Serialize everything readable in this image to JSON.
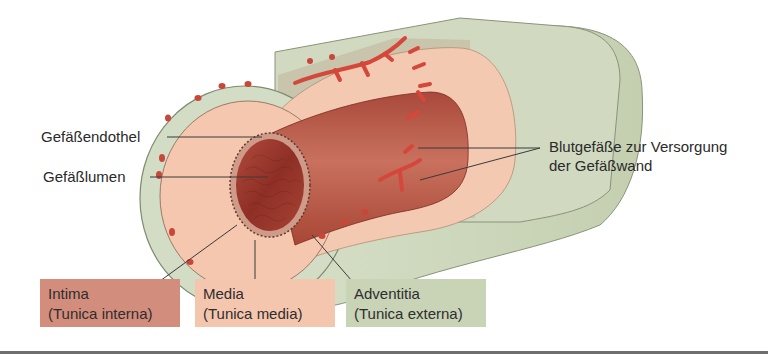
{
  "diagram": {
    "title": "",
    "colors": {
      "intima": "#d38d7c",
      "media": "#f5c6ae",
      "adventitia": "#c9d3b6",
      "adventitia_outer": "#d6dfc8",
      "lumen": "#9a3a2e",
      "vasa_vasorum": "#d8473a",
      "leader_line": "#3a3a3a"
    },
    "callouts": {
      "endothel": "Gefäßendothel",
      "lumen": "Gefäßlumen",
      "vasa_line1": "Blutgefäße zur Versorgung",
      "vasa_line2": "der Gefäßwand"
    },
    "layers": [
      {
        "name": "Intima",
        "latin": "(Tunica interna)",
        "color": "#d38d7c"
      },
      {
        "name": "Media",
        "latin": "(Tunica media)",
        "color": "#f5c6ae"
      },
      {
        "name": "Adventitia",
        "latin": "(Tunica externa)",
        "color": "#c9d3b6"
      }
    ]
  }
}
